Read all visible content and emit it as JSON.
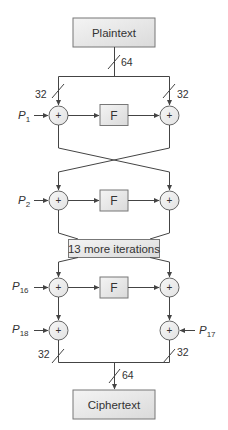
{
  "diagram": {
    "input_label": "Plaintext",
    "output_label": "Ciphertext",
    "function_label": "F",
    "xor_symbol": "+",
    "iterations_label": "13 more iterations",
    "bus_width_full": "64",
    "bus_width_half": "32",
    "subkeys": {
      "p1": {
        "base": "P",
        "sub": "1"
      },
      "p2": {
        "base": "P",
        "sub": "2"
      },
      "p16": {
        "base": "P",
        "sub": "16"
      },
      "p17": {
        "base": "P",
        "sub": "17"
      },
      "p18": {
        "base": "P",
        "sub": "18"
      }
    },
    "colors": {
      "box_fill_top": "#f2f2f2",
      "box_fill_bottom": "#d9d9d9",
      "stroke": "#444444",
      "text": "#333333"
    }
  }
}
